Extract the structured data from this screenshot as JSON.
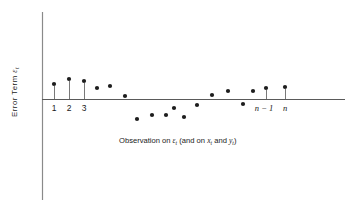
{
  "chart_data": {
    "type": "scatter",
    "title": "",
    "xlabel": "Observation on εt (and on xt and yt)",
    "ylabel": "Error Term εt",
    "xlabel_parts": {
      "lead": "Observation on ",
      "eps": "ε",
      "eps_sub": "t",
      "mid": " (and on ",
      "x": "x",
      "x_sub": "t",
      "and": " and ",
      "y": "y",
      "y_sub": "t",
      "close": ")"
    },
    "ylabel_parts": {
      "lead": "Error Term ",
      "eps": "ε",
      "eps_sub": "t"
    },
    "xtick_labels": [
      "1",
      "2",
      "3",
      "n − 1",
      "n"
    ],
    "xtick_x": [
      54,
      69,
      84,
      264,
      285
    ],
    "grid": false,
    "legend": null,
    "axis_zero_y": 99,
    "xlim": [
      42,
      345
    ],
    "ylim_px": [
      60,
      130
    ],
    "points": [
      {
        "id": 1,
        "x": 54,
        "y": 84,
        "stem": true
      },
      {
        "id": 2,
        "x": 69,
        "y": 79,
        "stem": true
      },
      {
        "id": 3,
        "x": 84,
        "y": 81,
        "stem": true
      },
      {
        "id": 4,
        "x": 97,
        "y": 88,
        "stem": false
      },
      {
        "id": 5,
        "x": 110,
        "y": 86,
        "stem": false
      },
      {
        "id": 6,
        "x": 125,
        "y": 96,
        "stem": false
      },
      {
        "id": 7,
        "x": 137,
        "y": 119,
        "stem": false
      },
      {
        "id": 8,
        "x": 152,
        "y": 115,
        "stem": false
      },
      {
        "id": 9,
        "x": 166,
        "y": 115,
        "stem": false
      },
      {
        "id": 10,
        "x": 174,
        "y": 108,
        "stem": false
      },
      {
        "id": 11,
        "x": 184,
        "y": 117,
        "stem": false
      },
      {
        "id": 12,
        "x": 197,
        "y": 105,
        "stem": false
      },
      {
        "id": 13,
        "x": 212,
        "y": 95,
        "stem": false
      },
      {
        "id": 14,
        "x": 228,
        "y": 91,
        "stem": false
      },
      {
        "id": 15,
        "x": 243,
        "y": 104,
        "stem": false
      },
      {
        "id": 16,
        "x": 253,
        "y": 91,
        "stem": false
      },
      {
        "id": 17,
        "x": 266,
        "y": 88,
        "stem": true
      },
      {
        "id": 18,
        "x": 285,
        "y": 87,
        "stem": true
      }
    ],
    "point_color": "#1d1d1d",
    "axis_color": "#5a5a5a",
    "background": "#ffffff"
  }
}
